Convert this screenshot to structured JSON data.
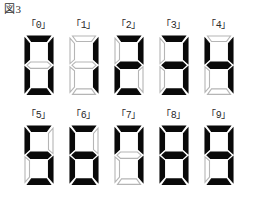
{
  "figure": {
    "title": "図3"
  },
  "display": {
    "segment_on_color": "#0a0a0a",
    "segment_off_color": "#ffffff",
    "segment_outline_color": "#b5b5b5",
    "background_color": "#ffffff",
    "segment_order": [
      "top",
      "top-left",
      "top-right",
      "middle",
      "bottom-left",
      "bottom-right",
      "bottom"
    ],
    "rows": [
      {
        "digits": [
          {
            "label": "「0」",
            "value": "0",
            "segments": {
              "top": true,
              "top-left": true,
              "top-right": true,
              "middle": false,
              "bottom-left": true,
              "bottom-right": true,
              "bottom": true
            }
          },
          {
            "label": "「1」",
            "value": "1",
            "segments": {
              "top": false,
              "top-left": false,
              "top-right": true,
              "middle": false,
              "bottom-left": false,
              "bottom-right": true,
              "bottom": false
            }
          },
          {
            "label": "「2」",
            "value": "2",
            "segments": {
              "top": true,
              "top-left": false,
              "top-right": true,
              "middle": true,
              "bottom-left": true,
              "bottom-right": false,
              "bottom": true
            }
          },
          {
            "label": "「3」",
            "value": "3",
            "segments": {
              "top": true,
              "top-left": false,
              "top-right": true,
              "middle": true,
              "bottom-left": false,
              "bottom-right": true,
              "bottom": true
            }
          },
          {
            "label": "「4」",
            "value": "4",
            "segments": {
              "top": false,
              "top-left": true,
              "top-right": true,
              "middle": true,
              "bottom-left": false,
              "bottom-right": true,
              "bottom": false
            }
          }
        ]
      },
      {
        "digits": [
          {
            "label": "「5」",
            "value": "5",
            "segments": {
              "top": true,
              "top-left": true,
              "top-right": false,
              "middle": true,
              "bottom-left": false,
              "bottom-right": true,
              "bottom": true
            }
          },
          {
            "label": "「6」",
            "value": "6",
            "segments": {
              "top": true,
              "top-left": true,
              "top-right": false,
              "middle": true,
              "bottom-left": true,
              "bottom-right": true,
              "bottom": true
            }
          },
          {
            "label": "「7」",
            "value": "7",
            "segments": {
              "top": true,
              "top-left": true,
              "top-right": true,
              "middle": false,
              "bottom-left": false,
              "bottom-right": true,
              "bottom": false
            }
          },
          {
            "label": "「8」",
            "value": "8",
            "segments": {
              "top": true,
              "top-left": true,
              "top-right": true,
              "middle": true,
              "bottom-left": true,
              "bottom-right": true,
              "bottom": true
            }
          },
          {
            "label": "「9」",
            "value": "9",
            "segments": {
              "top": true,
              "top-left": true,
              "top-right": true,
              "middle": true,
              "bottom-left": false,
              "bottom-right": true,
              "bottom": true
            }
          }
        ]
      }
    ]
  }
}
